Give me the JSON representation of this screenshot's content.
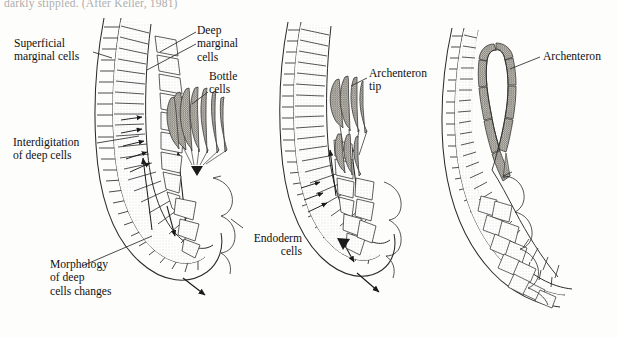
{
  "figure": {
    "caption_fragment": "darkly stippled. (After Keller, 1981)"
  },
  "labels": {
    "superficial_marginal_cells": "Superficial\nmarginal cells",
    "deep_marginal_cells": "Deep\nmarginal\ncells",
    "bottle_cells": "Bottle\ncells",
    "interdigitation": "Interdigitation\nof deep cells",
    "morphology_changes": "Morphology\nof deep\ncells changes",
    "endoderm_cells": "Endoderm\ncells",
    "archenteron_tip": "Archenteron\ntip",
    "archenteron": "Archenteron"
  },
  "panels": [
    {
      "id": "panel-1",
      "stage": "early gastrula",
      "features": [
        "superficial marginal cells",
        "deep marginal cells",
        "bottle cells",
        "interdigitation of deep cells",
        "endoderm cells"
      ]
    },
    {
      "id": "panel-2",
      "stage": "mid gastrula",
      "features": [
        "archenteron tip",
        "endoderm cells"
      ]
    },
    {
      "id": "panel-3",
      "stage": "late gastrula",
      "features": [
        "archenteron"
      ]
    }
  ],
  "colors": {
    "ink": "#1a1a1a",
    "line": "#2b2b2b",
    "stipple_light": "#ebe9e4",
    "stipple_mid": "#d8d5cd",
    "stipple_dark": "#9a978f",
    "bottle_cell": "#8d8a82",
    "background": "#fdfdfc",
    "leader": "#2b2b2b"
  }
}
